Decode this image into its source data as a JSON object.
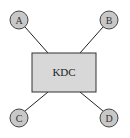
{
  "diagram": {
    "type": "star-topology",
    "center": {
      "label": "KDC",
      "x": 32,
      "y": 53,
      "width": 64,
      "height": 39,
      "fill": "#d8d8d8",
      "stroke": "#333333"
    },
    "nodes": [
      {
        "id": "A",
        "label": "A",
        "cx": 19,
        "cy": 20,
        "r": 9,
        "line_to": [
          48,
          53
        ]
      },
      {
        "id": "B",
        "label": "B",
        "cx": 109,
        "cy": 20,
        "r": 9,
        "line_to": [
          80,
          53
        ]
      },
      {
        "id": "C",
        "label": "C",
        "cx": 19,
        "cy": 118,
        "r": 9,
        "line_to": [
          48,
          92
        ]
      },
      {
        "id": "D",
        "label": "D",
        "cx": 109,
        "cy": 118,
        "r": 9,
        "line_to": [
          80,
          92
        ]
      }
    ],
    "node_fill": "#c8c8c8",
    "node_stroke": "#444444",
    "line_color": "#222222"
  }
}
